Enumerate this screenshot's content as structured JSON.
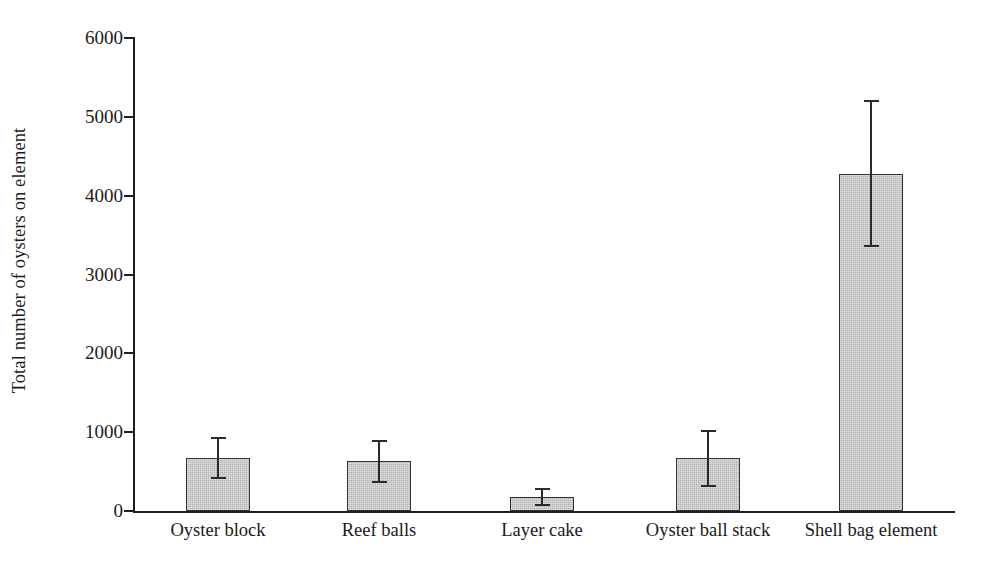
{
  "chart_data": {
    "type": "bar",
    "title": "",
    "subtitle": "",
    "xlabel": "",
    "ylabel": "Total number of oysters on element",
    "categories": [
      "Oyster block",
      "Reef balls",
      "Layer cake",
      "Oyster ball stack",
      "Shell bag element"
    ],
    "values": [
      670,
      630,
      180,
      670,
      4280
    ],
    "errors": [
      250,
      260,
      100,
      350,
      920
    ],
    "error_type": "symmetric",
    "series": [
      {
        "name": "Total number of oysters on element",
        "values": [
          670,
          630,
          180,
          670,
          4280
        ],
        "errors": [
          250,
          260,
          100,
          350,
          920
        ]
      }
    ],
    "points": [
      {
        "category": "Oyster block",
        "value": 670,
        "error": 250,
        "low": 420,
        "high": 920
      },
      {
        "category": "Reef balls",
        "value": 630,
        "error": 260,
        "low": 370,
        "high": 890
      },
      {
        "category": "Layer cake",
        "value": 180,
        "error": 100,
        "low": 80,
        "high": 280
      },
      {
        "category": "Oyster ball stack",
        "value": 670,
        "error": 350,
        "low": 320,
        "high": 1020
      },
      {
        "category": "Shell bag element",
        "value": 4280,
        "error": 920,
        "low": 3360,
        "high": 5200
      }
    ],
    "ylim": [
      0,
      6000
    ],
    "yticks": [
      0,
      1000,
      2000,
      3000,
      4000,
      5000,
      6000
    ],
    "ytick_labels": [
      "0",
      "1000",
      "2000",
      "3000",
      "4000",
      "5000",
      "6000"
    ],
    "grid": false,
    "legend": false,
    "legend_position": "none",
    "bar_fill_color": "#c6c6c6",
    "bar_edge_color": "#333333",
    "error_color": "#2a2a2a",
    "background_color": "#ffffff"
  },
  "axis": {
    "y_label": "Total number of oysters on element",
    "y_tick_0": "0",
    "y_tick_1": "1000",
    "y_tick_2": "2000",
    "y_tick_3": "3000",
    "y_tick_4": "4000",
    "y_tick_5": "5000",
    "y_tick_6": "6000"
  },
  "bars": [
    {
      "label": "Oyster block"
    },
    {
      "label": "Reef balls"
    },
    {
      "label": "Layer cake"
    },
    {
      "label": "Oyster ball stack"
    },
    {
      "label": "Shell bag element"
    }
  ]
}
